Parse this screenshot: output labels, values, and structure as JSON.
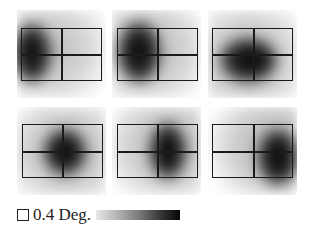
{
  "figure": {
    "panels": [
      {
        "id": 1,
        "row": 1,
        "col": 1,
        "peak_region": "left",
        "blob": {
          "cx": 0.18,
          "cy": 0.5,
          "rx": 0.22,
          "ry": 0.32
        },
        "bg_tint": "#9a9a9a"
      },
      {
        "id": 2,
        "row": 1,
        "col": 2,
        "peak_region": "left-center",
        "blob": {
          "cx": 0.3,
          "cy": 0.48,
          "rx": 0.23,
          "ry": 0.33
        },
        "bg_tint": "#9a9a9a"
      },
      {
        "id": 3,
        "row": 1,
        "col": 3,
        "peak_region": "center-lower",
        "blob": {
          "cx": 0.42,
          "cy": 0.58,
          "rx": 0.3,
          "ry": 0.25
        },
        "bg_tint": "#9a9a9a"
      },
      {
        "id": 4,
        "row": 2,
        "col": 1,
        "peak_region": "center",
        "blob": {
          "cx": 0.54,
          "cy": 0.52,
          "rx": 0.24,
          "ry": 0.27
        },
        "bg_tint": "#9a9a9a"
      },
      {
        "id": 5,
        "row": 2,
        "col": 2,
        "peak_region": "center-right",
        "blob": {
          "cx": 0.62,
          "cy": 0.5,
          "rx": 0.2,
          "ry": 0.32
        },
        "bg_tint": "#9a9a9a"
      },
      {
        "id": 6,
        "row": 2,
        "col": 3,
        "peak_region": "right",
        "blob": {
          "cx": 0.78,
          "cy": 0.58,
          "rx": 0.22,
          "ry": 0.33
        },
        "bg_tint": "#9a9a9a"
      }
    ]
  },
  "legend": {
    "scale_label": "0.4 Deg.",
    "scale_icon": "square-outline-icon",
    "colorbar": {
      "from": "#e8e8e8",
      "to": "#050505",
      "meaning": "low-to-high density"
    }
  }
}
